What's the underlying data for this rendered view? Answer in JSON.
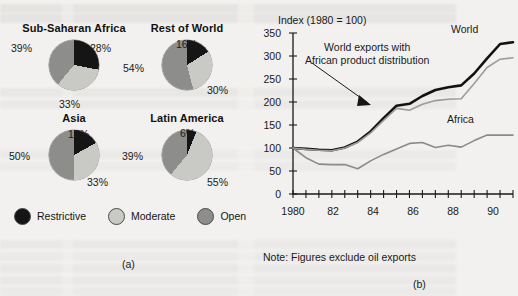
{
  "figure": {
    "caption_a": "(a)",
    "caption_b": "(b)"
  },
  "panel_a": {
    "legend": [
      {
        "label": "Restrictive",
        "color": "#151515",
        "key": "restrictive"
      },
      {
        "label": "Moderate",
        "color": "#c9c9c6",
        "key": "moderate"
      },
      {
        "label": "Open",
        "color": "#8d8d8b",
        "key": "open"
      }
    ],
    "charts": [
      {
        "title": "Sub-Saharan Africa",
        "labels": {
          "restrictive": "28%",
          "moderate": "33%",
          "open": "39%"
        },
        "values": {
          "restrictive": 28,
          "moderate": 33,
          "open": 39
        }
      },
      {
        "title": "Rest of World",
        "labels": {
          "restrictive": "16%",
          "moderate": "30%",
          "open": "54%"
        },
        "values": {
          "restrictive": 16,
          "moderate": 30,
          "open": 54
        }
      },
      {
        "title": "Asia",
        "labels": {
          "restrictive": "17%",
          "moderate": "33%",
          "open": "50%"
        },
        "values": {
          "restrictive": 17,
          "moderate": 33,
          "open": 50
        }
      },
      {
        "title": "Latin America",
        "labels": {
          "restrictive": "6%",
          "moderate": "55%",
          "open": "39%"
        },
        "values": {
          "restrictive": 6,
          "moderate": 55,
          "open": 39
        }
      }
    ]
  },
  "panel_b": {
    "axis_title": "Index (1980 = 100)",
    "annotation": "World exports with\nAfrican product distribution",
    "annotation_line1": "World exports with",
    "annotation_line2": "African product distribution",
    "note": "Note: Figures exclude oil exports",
    "series_labels": {
      "world": "World",
      "africa": "Africa"
    }
  },
  "chart_data": {
    "type": "line",
    "title": "Index (1980 = 100)",
    "xlabel": "",
    "ylabel": "Index (1980 = 100)",
    "xlim": [
      1980,
      1997
    ],
    "ylim": [
      0,
      350
    ],
    "yticks": [
      0,
      50,
      100,
      150,
      200,
      250,
      300,
      350
    ],
    "ytick_labels": [
      "0",
      "50",
      "100",
      "150",
      "200",
      "250",
      "300",
      "350"
    ],
    "xticks": [
      1980,
      1981,
      1982,
      1983,
      1984,
      1985,
      1986,
      1987,
      1988,
      1989,
      1990,
      1991,
      1992,
      1993,
      1994,
      1995,
      1996,
      1997
    ],
    "xtick_labels": [
      "1980",
      "",
      "82",
      "",
      "84",
      "",
      "86",
      "",
      "88",
      "",
      "90",
      "",
      "92",
      "",
      "94",
      "",
      "96",
      ""
    ],
    "grid": false,
    "legend_position": "inline-annotations",
    "note": "Note: Figures exclude oil exports",
    "x": [
      1980,
      1981,
      1982,
      1983,
      1984,
      1985,
      1986,
      1987,
      1988,
      1989,
      1990,
      1991,
      1992,
      1993,
      1994,
      1995,
      1996,
      1997
    ],
    "series": [
      {
        "name": "World",
        "color": "#121212",
        "values": [
          100,
          98,
          96,
          95,
          101,
          114,
          136,
          165,
          192,
          196,
          213,
          226,
          232,
          236,
          262,
          295,
          326,
          330
        ]
      },
      {
        "name": "World exports with African product distribution",
        "color": "#9b9b99",
        "values": [
          100,
          97,
          95,
          94,
          100,
          112,
          133,
          160,
          186,
          182,
          195,
          203,
          206,
          207,
          240,
          275,
          293,
          296
        ]
      },
      {
        "name": "Africa",
        "color": "#8a8a88",
        "values": [
          100,
          79,
          65,
          64,
          64,
          55,
          72,
          86,
          98,
          110,
          112,
          101,
          106,
          102,
          116,
          128,
          128,
          128
        ]
      }
    ]
  }
}
